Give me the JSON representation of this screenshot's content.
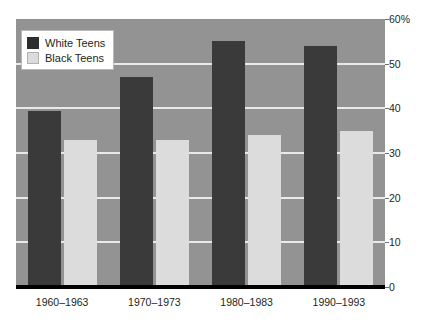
{
  "chart_data": {
    "type": "bar",
    "title": "",
    "subtitle": "",
    "xlabel": "",
    "ylabel": "",
    "categories": [
      "1960–1963",
      "1970–1973",
      "1980–1983",
      "1990–1993"
    ],
    "series": [
      {
        "name": "White Teens",
        "color": "#3a3a3a",
        "values": [
          39.5,
          47,
          55,
          54
        ]
      },
      {
        "name": "Black Teens",
        "color": "#dcdcdc",
        "values": [
          33,
          33,
          34,
          35
        ]
      }
    ],
    "ylim": [
      0,
      60
    ],
    "ytick_labels": [
      "0",
      "10",
      "20",
      "30",
      "40",
      "50",
      "60%"
    ],
    "ytick_values": [
      0,
      10,
      20,
      30,
      40,
      50,
      60
    ],
    "grid": true,
    "gridline_values": [
      10,
      20,
      30,
      40,
      50
    ],
    "legend_position": "top-left",
    "plot_background": "#939393",
    "gridline_color": "#e9e9e9",
    "axis_color": "#000000"
  },
  "legend": {
    "entries": [
      {
        "label": "White Teens"
      },
      {
        "label": "Black Teens"
      }
    ]
  }
}
